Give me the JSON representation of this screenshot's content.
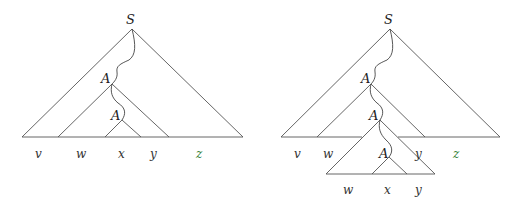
{
  "colors": {
    "line": "#555555",
    "text": "#333333",
    "highlight": "#2e7d32"
  },
  "left_tree": {
    "root_label": "S",
    "mid_label": "A",
    "inner_label": "A",
    "leaves": [
      "v",
      "w",
      "x",
      "y",
      "z"
    ]
  },
  "right_tree": {
    "root_label": "S",
    "mid_label": "A",
    "pumped_label": "A",
    "inner_label": "A",
    "leaves": [
      "v",
      "w",
      "y",
      "z"
    ],
    "pumped_leaves": [
      "w",
      "x",
      "y"
    ]
  }
}
